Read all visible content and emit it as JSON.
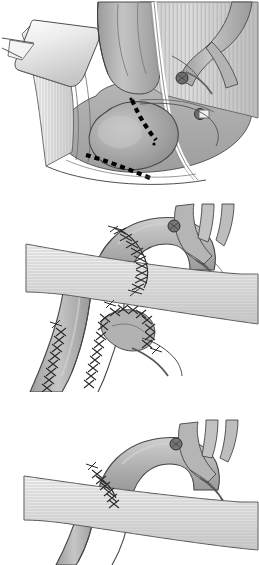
{
  "figure": {
    "style": "grayscale line-and-tone medical illustration",
    "panel_count": 3,
    "background_color": "#ffffff",
    "line_color": "#3a3a3a",
    "width": 259,
    "height": 565
  },
  "palette": {
    "outline": "#404040",
    "outline_dark": "#2b2b2b",
    "vessel_light": "#d8d8d8",
    "vessel_mid": "#b4b4b4",
    "vessel_dark": "#8e8e8e",
    "vessel_shadow": "#6f6f6f",
    "aneurysm_fill": "#a6a6a6",
    "aneurysm_highlight": "#cfcfcf",
    "muscle_light": "#efefef",
    "muscle_mid": "#d4d4d4",
    "striation": "#b9b9b9",
    "retractor_light": "#f2f2f2",
    "retractor_mid": "#d0d0d0",
    "clip_fill": "#6a6a6a",
    "incision_dash": "#000000",
    "suture_thread": "#2a2a2a",
    "white": "#ffffff"
  },
  "panels": [
    {
      "id": "panel-1",
      "index": 1,
      "label": "Panel 1 — exposure of aortic arch aneurysm with planned incision lines",
      "top": 0,
      "height": 190,
      "elements": [
        {
          "name": "surgical-retractor",
          "desc": "metal retractor blade, upper left, light specular shading"
        },
        {
          "name": "striated-muscle-left",
          "desc": "vertically striated muscle / sternal edge, left side"
        },
        {
          "name": "striated-muscle-right",
          "desc": "vertically striated tissue field, right side"
        },
        {
          "name": "aortic-arch-aneurysm",
          "desc": "large rounded aneurysmal sac, mid-lower center, highlighted dome"
        },
        {
          "name": "ascending-aorta",
          "desc": "vessel trunk rising from aneurysm toward top center"
        },
        {
          "name": "arch-branch-vessels",
          "desc": "branching head-and-neck vessels, upper right"
        },
        {
          "name": "vessel-loop-tape",
          "desc": "white vessel loop/tape passing vertically at right of field"
        },
        {
          "name": "clip-upper",
          "desc": "dark surgical clip on branch vessel, upper right"
        },
        {
          "name": "clip-lower",
          "desc": "dark surgical clip on branch vessel, right"
        },
        {
          "name": "incision-line-vertical",
          "desc": "black square-dashed planned incision descending across aneurysm"
        },
        {
          "name": "incision-line-diagonal",
          "desc": "black square-dashed planned incision sweeping lower left to lower right"
        },
        {
          "name": "incision-endpoint-dot",
          "desc": "small dot marking incision terminus"
        }
      ],
      "dash_marks": {
        "pattern": "square black dashes",
        "count_vertical": 7,
        "count_diagonal": 8
      }
    },
    {
      "id": "panel-2",
      "index": 2,
      "label": "Panel 2 — reconstructed arch with running suture lines and anastomosed branch patch",
      "top": 196,
      "height": 196,
      "elements": [
        {
          "name": "aortic-arch",
          "desc": "curved aortic arch running left-to-right across upper field"
        },
        {
          "name": "descending-aorta",
          "desc": "aorta descending steeply toward lower left"
        },
        {
          "name": "arch-branch-vessels",
          "desc": "three head-and-neck branch vessels rising, upper right"
        },
        {
          "name": "clip-on-branch",
          "desc": "dark surgical clip at base of branch vessel"
        },
        {
          "name": "muscle-band",
          "desc": "broad horizontally striated tissue band crossing the field"
        },
        {
          "name": "suture-line-arch",
          "desc": "running cross-stitch suture along the arch graft anastomosis"
        },
        {
          "name": "suture-line-descending",
          "desc": "long running cross-stitch suture down the descending aorta"
        },
        {
          "name": "branch-patch",
          "desc": "anastomosed branch patch with surrounding suture line, lower center"
        },
        {
          "name": "suture-line-patch",
          "desc": "cross-stitch suture encircling the branch patch"
        }
      ],
      "suture_style": {
        "stitch": "cross/zigzag ladder",
        "color": "#2a2a2a"
      }
    },
    {
      "id": "panel-3",
      "index": 3,
      "label": "Panel 3 — completed repair, single suture line on arch with tissue band restored",
      "top": 398,
      "height": 167,
      "elements": [
        {
          "name": "aortic-arch",
          "desc": "completed curved aortic arch, upper center"
        },
        {
          "name": "descending-aorta",
          "desc": "aorta descending toward lower left behind tissue band"
        },
        {
          "name": "arch-branch-vessels",
          "desc": "three head-and-neck branch vessels rising, upper right"
        },
        {
          "name": "clip-on-branch",
          "desc": "dark surgical clip at base of branch vessel"
        },
        {
          "name": "muscle-band",
          "desc": "broad horizontally striated tissue band crossing the field"
        },
        {
          "name": "suture-line-arch",
          "desc": "short running cross-stitch suture at proximal arch anastomosis"
        }
      ],
      "suture_style": {
        "stitch": "cross/zigzag ladder",
        "color": "#2a2a2a"
      }
    }
  ]
}
